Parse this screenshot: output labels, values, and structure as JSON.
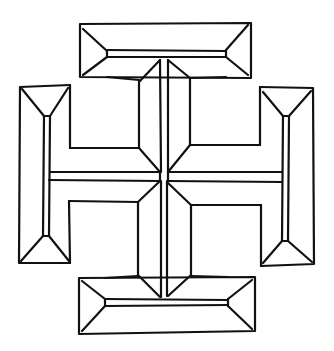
{
  "figure": {
    "stroke_color": "#111111",
    "background_color": "#ffffff"
  },
  "parts": [
    {
      "name": "top-terminal"
    },
    {
      "name": "bottom-terminal"
    },
    {
      "name": "left-terminal"
    },
    {
      "name": "right-terminal"
    },
    {
      "name": "upper-left-arm"
    },
    {
      "name": "upper-right-arm"
    },
    {
      "name": "lower-left-arm"
    },
    {
      "name": "lower-right-arm"
    }
  ]
}
